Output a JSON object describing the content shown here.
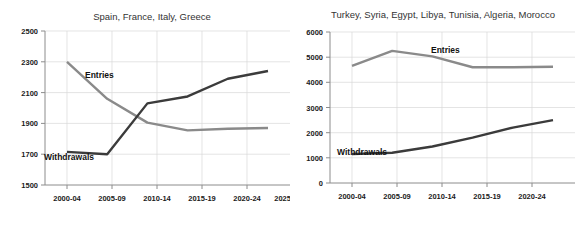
{
  "figure": {
    "background": "#ffffff",
    "width": 579,
    "height": 225
  },
  "colors": {
    "entries": "#8a8a8a",
    "withdrawals": "#3b3b3b",
    "grid": "#d9d9d9",
    "axis": "#8c8c8c",
    "title_text": "#333333",
    "tick_text": "#1a1a1a"
  },
  "chart_data": [
    {
      "type": "line",
      "title": "Spain, France, Italy, Greece",
      "xlabel": "",
      "ylabel": "",
      "categories": [
        "2000-04",
        "2005-09",
        "2010-14",
        "2015-19",
        "2020-24",
        "2025-29"
      ],
      "ylim": [
        1500,
        2500
      ],
      "yticks": [
        1500,
        1700,
        1900,
        2100,
        2300,
        2500
      ],
      "grid": true,
      "legend": "inline-annotations",
      "series": [
        {
          "name": "Entries",
          "color": "#8a8a8a",
          "values": [
            2300,
            2060,
            1905,
            1855,
            1865,
            1870
          ],
          "label_text": "Entries"
        },
        {
          "name": "Withdrawals",
          "color": "#3b3b3b",
          "values": [
            1715,
            1700,
            2030,
            2075,
            2190,
            2240
          ],
          "label_text": "Withdrawals"
        }
      ]
    },
    {
      "type": "line",
      "title": "Turkey, Syria, Egypt, Libya, Tunisia, Algeria, Morocco",
      "xlabel": "",
      "ylabel": "",
      "categories": [
        "2000-04",
        "2005-09",
        "2010-14",
        "2015-19",
        "2020-24",
        "2025-29"
      ],
      "ylim": [
        0,
        6000
      ],
      "yticks": [
        0,
        1000,
        2000,
        3000,
        4000,
        5000,
        6000
      ],
      "grid": true,
      "legend": "inline-annotations",
      "series": [
        {
          "name": "Entries",
          "color": "#8a8a8a",
          "values": [
            4650,
            5250,
            5030,
            4600,
            4600,
            4620
          ],
          "label_text": "Entries"
        },
        {
          "name": "Withdrawals",
          "color": "#3b3b3b",
          "values": [
            1150,
            1200,
            1450,
            1800,
            2200,
            2500
          ],
          "label_text": "Withdrawals"
        }
      ]
    }
  ],
  "panels": {
    "left": {
      "title": "Spain, France, Italy, Greece",
      "ytick_labels": [
        "2500",
        "2300",
        "2100",
        "1900",
        "1700",
        "1500"
      ],
      "xtick_labels": [
        "2000-04",
        "2005-09",
        "2010-14",
        "2015-19",
        "2020-24",
        "2025-29"
      ],
      "entries_label": "Entries",
      "withdrawals_label": "Withdrawals"
    },
    "right": {
      "title": "Turkey, Syria, Egypt, Libya, Tunisia, Algeria, Morocco",
      "ytick_labels": [
        "6000",
        "5000",
        "4000",
        "3000",
        "2000",
        "1000",
        "0"
      ],
      "xtick_labels": [
        "2000-04",
        "2005-09",
        "2010-14",
        "2015-19",
        "2020-24",
        "2025-29"
      ],
      "entries_label": "Entries",
      "withdrawals_label": "Withdrawals"
    }
  }
}
